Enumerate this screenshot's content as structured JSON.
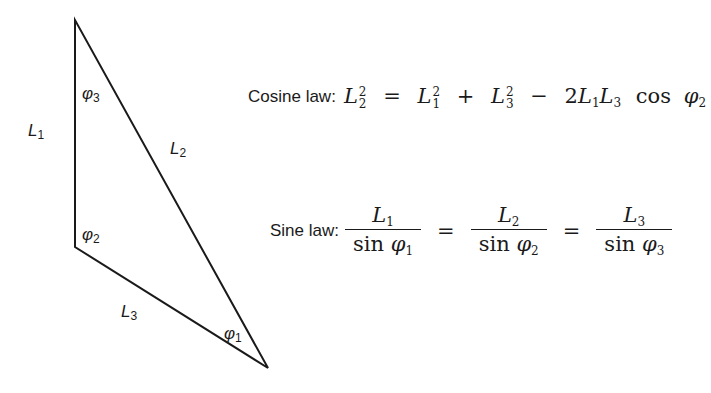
{
  "triangle": {
    "vertices": {
      "top": [
        75,
        20
      ],
      "left_bottom": [
        75,
        247
      ],
      "right_bottom": [
        268,
        368
      ]
    },
    "sides": {
      "L1": "L",
      "L1_sub": "1",
      "L2": "L",
      "L2_sub": "2",
      "L3": "L",
      "L3_sub": "3"
    },
    "angles": {
      "phi3": "φ",
      "phi3_sub": "3",
      "phi2": "φ",
      "phi2_sub": "2",
      "phi1": "φ",
      "phi1_sub": "1"
    },
    "stroke_color": "#1a1a1a"
  },
  "cosine_law": {
    "label": "Cosine law:",
    "lhs": "L",
    "lhs_sub": "2",
    "lhs_sup": "2",
    "eq": "=",
    "t1": "L",
    "t1_sub": "1",
    "t1_sup": "2",
    "plus": "+",
    "t2": "L",
    "t2_sub": "3",
    "t2_sup": "2",
    "minus": "−",
    "coef": "2",
    "a": "L",
    "a_sub": "1",
    "b": "L",
    "b_sub": "3",
    "func": "cos",
    "ang": "φ",
    "ang_sub": "2"
  },
  "sine_law": {
    "label": "Sine law:",
    "eq": "=",
    "fracs": [
      {
        "num": "L",
        "num_sub": "1",
        "func": "sin",
        "den": "φ",
        "den_sub": "1"
      },
      {
        "num": "L",
        "num_sub": "2",
        "func": "sin",
        "den": "φ",
        "den_sub": "2"
      },
      {
        "num": "L",
        "num_sub": "3",
        "func": "sin",
        "den": "φ",
        "den_sub": "3"
      }
    ]
  }
}
